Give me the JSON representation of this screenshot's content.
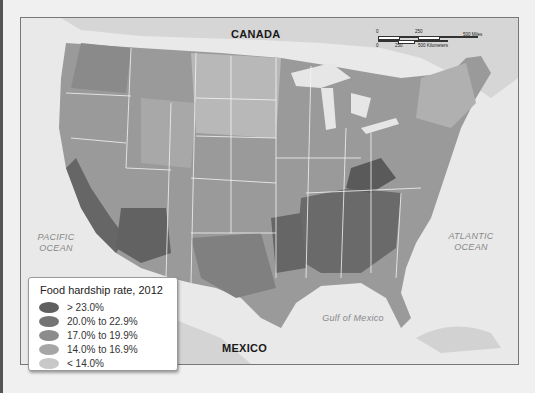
{
  "map": {
    "title": "Food hardship rate, 2012",
    "labels": {
      "canada": "CANADA",
      "mexico": "MEXICO",
      "pacific_line1": "PACIFIC",
      "pacific_line2": "OCEAN",
      "atlantic_line1": "ATLANTIC",
      "atlantic_line2": "OCEAN",
      "gulf": "Gulf of Mexico"
    },
    "scale": {
      "miles_ticks": [
        "0",
        "250",
        "500 Miles"
      ],
      "km_ticks": [
        "0",
        "250",
        "500 Kilometers"
      ]
    }
  },
  "legend": {
    "title": "Food hardship rate, 2012",
    "items": [
      {
        "label": "> 23.0%",
        "color": "#5f5f5f"
      },
      {
        "label": "20.0% to 22.9%",
        "color": "#747474"
      },
      {
        "label": "17.0% to 19.9%",
        "color": "#8c8c8c"
      },
      {
        "label": "14.0% to 16.9%",
        "color": "#a6a6a6"
      },
      {
        "label": "< 14.0%",
        "color": "#c8c8c8"
      }
    ]
  },
  "colors": {
    "background": "#f0f0f0",
    "water": "#e9e9e9",
    "land_outside": "#d4d4d4",
    "state_border": "#f4f4f4"
  }
}
